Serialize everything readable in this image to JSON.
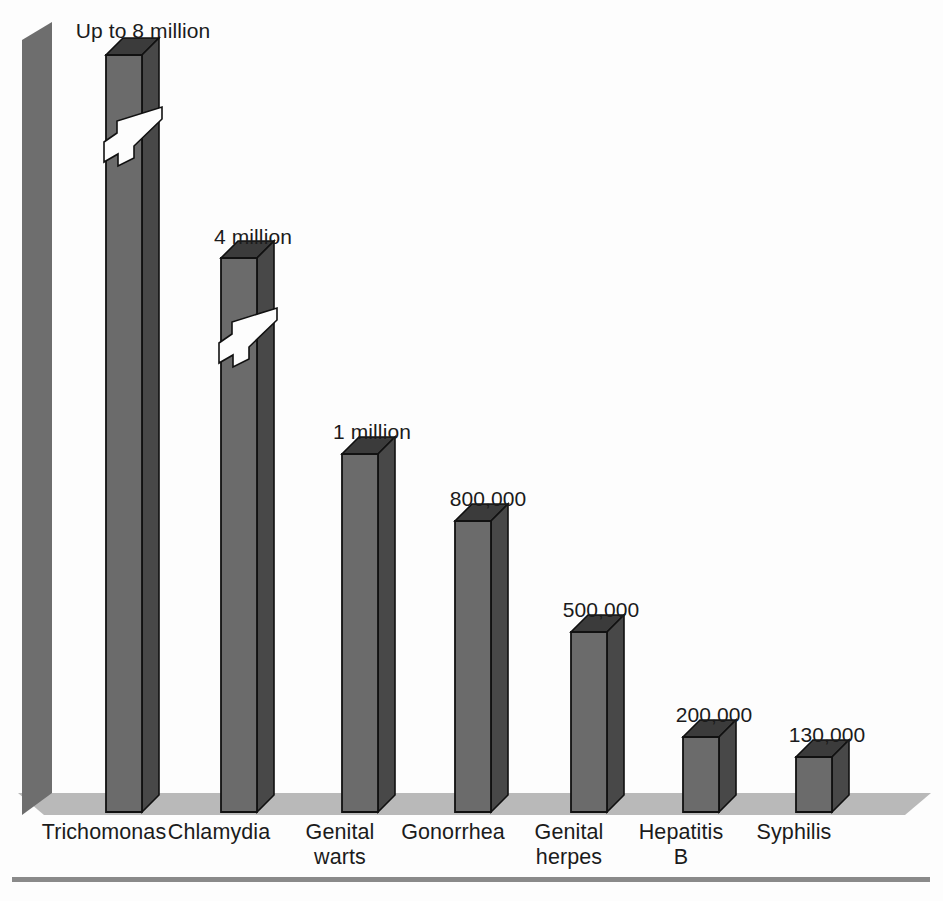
{
  "figure": {
    "background": "#fdfdfd",
    "floor_color": "#b9b9b9",
    "wall_color": "#6e6e6e",
    "bar_front_color": "#6b6b6b",
    "bar_side_color": "#484848",
    "bar_top_color": "#3b3b3b",
    "rule_color": "#8a8a8a",
    "text_color": "#1b1b1b"
  },
  "chart_data": {
    "type": "bar",
    "title": "",
    "subtitle": "",
    "xlabel": "",
    "ylabel": "",
    "grid": false,
    "legend": "none",
    "note": "3-D column chart; the two tallest columns are drawn with zigzag break marks indicating a truncated vertical scale.",
    "categories": [
      "Trichomonas",
      "Chlamydia",
      "Genital warts",
      "Gonorrhea",
      "Genital herpes",
      "Hepatitis B",
      "Syphilis"
    ],
    "category_lines": [
      [
        "Trichomonas"
      ],
      [
        "Chlamydia"
      ],
      [
        "Genital",
        "warts"
      ],
      [
        "Gonorrhea"
      ],
      [
        "Genital",
        "herpes"
      ],
      [
        "Hepatitis",
        "B"
      ],
      [
        "Syphilis"
      ]
    ],
    "values": [
      8000000,
      4000000,
      1000000,
      800000,
      500000,
      200000,
      130000
    ],
    "value_labels": [
      "Up to 8 million",
      "4 million",
      "1 million",
      "800,000",
      "500,000",
      "200,000",
      "130,000"
    ],
    "broken_axis_bars": [
      0,
      1
    ],
    "ylim": [
      0,
      8000000
    ]
  },
  "bars": [
    {
      "name": "trichomonas",
      "x": 106,
      "top": 55,
      "label": "Up to 8 million",
      "label_x": 143,
      "label_y": 19,
      "broken": true,
      "break_y": 132
    },
    {
      "name": "chlamydia",
      "x": 221,
      "top": 258,
      "label": "4 million",
      "label_x": 253,
      "label_y": 225,
      "broken": true,
      "break_y": 333
    },
    {
      "name": "genital-warts",
      "x": 342,
      "top": 454,
      "label": "1 million",
      "label_x": 372,
      "label_y": 420,
      "broken": false,
      "break_y": 0
    },
    {
      "name": "gonorrhea",
      "x": 455,
      "top": 521,
      "label": "800,000",
      "label_x": 488,
      "label_y": 487,
      "broken": false,
      "break_y": 0
    },
    {
      "name": "genital-herpes",
      "x": 571,
      "top": 632,
      "label": "500,000",
      "label_x": 601,
      "label_y": 598,
      "broken": false,
      "break_y": 0
    },
    {
      "name": "hepatitis-b",
      "x": 683,
      "top": 737,
      "label": "200,000",
      "label_x": 714,
      "label_y": 703,
      "broken": false,
      "break_y": 0
    },
    {
      "name": "syphilis",
      "x": 796,
      "top": 757,
      "label": "130,000",
      "label_x": 827,
      "label_y": 723,
      "broken": false,
      "break_y": 0
    }
  ],
  "category_label_positions": [
    {
      "x": 104,
      "y": 820
    },
    {
      "x": 219,
      "y": 820
    },
    {
      "x": 340,
      "y": 820
    },
    {
      "x": 453,
      "y": 820
    },
    {
      "x": 569,
      "y": 820
    },
    {
      "x": 681,
      "y": 820
    },
    {
      "x": 794,
      "y": 820
    }
  ]
}
